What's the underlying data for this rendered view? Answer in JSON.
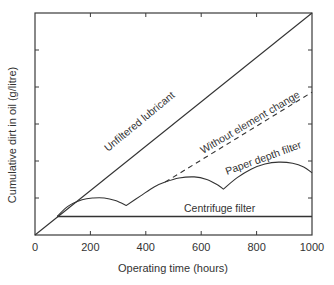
{
  "chart_data": {
    "type": "line",
    "title": "",
    "xlabel": "Operating time (hours)",
    "ylabel": "Cumulative dirt in oil (g/litre)",
    "xlim": [
      0,
      1000
    ],
    "ylim": [
      0,
      6
    ],
    "x_ticks": [
      0,
      200,
      400,
      600,
      800,
      1000
    ],
    "x_tick_labels": [
      "0",
      "200",
      "400",
      "600",
      "800",
      "1000"
    ],
    "y_ticks": [
      0,
      1,
      2,
      3,
      4,
      5,
      6
    ],
    "y_tick_labels": [],
    "grid": false,
    "legend": "none",
    "series": [
      {
        "name": "Unfiltered lubricant",
        "style": "solid",
        "points": [
          [
            0,
            0
          ],
          [
            1000,
            6
          ]
        ]
      },
      {
        "name": "Without element change",
        "style": "dashed",
        "points": [
          [
            470,
            1.43
          ],
          [
            1000,
            3.86
          ]
        ]
      },
      {
        "name": "Paper depth filter",
        "style": "solid",
        "points": [
          [
            80,
            0.5
          ],
          [
            120,
            0.78
          ],
          [
            170,
            0.95
          ],
          [
            210,
            1.0
          ],
          [
            250,
            1.0
          ],
          [
            290,
            0.93
          ],
          [
            330,
            0.8
          ],
          [
            380,
            1.05
          ],
          [
            430,
            1.3
          ],
          [
            470,
            1.43
          ],
          [
            520,
            1.54
          ],
          [
            575,
            1.57
          ],
          [
            620,
            1.5
          ],
          [
            660,
            1.35
          ],
          [
            680,
            1.24
          ],
          [
            730,
            1.55
          ],
          [
            780,
            1.78
          ],
          [
            830,
            1.92
          ],
          [
            880,
            1.97
          ],
          [
            930,
            1.94
          ],
          [
            970,
            1.84
          ],
          [
            1000,
            1.68
          ]
        ]
      },
      {
        "name": "Centrifuge filter",
        "style": "solid",
        "points": [
          [
            80,
            0.5
          ],
          [
            1000,
            0.5
          ]
        ]
      }
    ],
    "annotations": [
      {
        "text": "Unfiltered lubricant",
        "series": "Unfiltered lubricant"
      },
      {
        "text": "Without element change",
        "series": "Without element change"
      },
      {
        "text": "Paper depth filter",
        "series": "Paper depth filter"
      },
      {
        "text": "Centrifuge filter",
        "series": "Centrifuge filter"
      }
    ]
  }
}
